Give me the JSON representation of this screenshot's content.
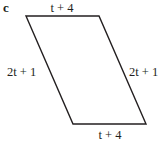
{
  "figure": {
    "part_label": "c",
    "shape": "parallelogram",
    "stroke_color": "#231f20",
    "vertices": {
      "top_left": [
        26,
        16
      ],
      "top_right": [
        99,
        16
      ],
      "bottom_right": [
        146,
        124
      ],
      "bottom_left": [
        73,
        124
      ]
    },
    "sides": {
      "top": "t + 4",
      "bottom": "t + 4",
      "left": "2t + 1",
      "right": "2t + 1"
    }
  }
}
